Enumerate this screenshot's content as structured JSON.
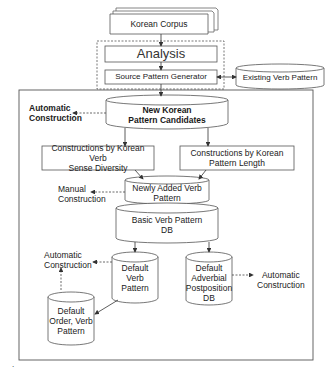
{
  "nodes": {
    "korean_corpus": "Korean Corpus",
    "analysis": "Analysis",
    "source_pattern_generator": "Source Pattern Generator",
    "existing_verb_pattern": "Existing Verb Pattern",
    "new_korean_pattern_candidates": [
      "New Korean",
      "Pattern Candidates"
    ],
    "constructions_sense_diversity": [
      "Constructions by Korean Verb",
      "Sense Diversity"
    ],
    "constructions_pattern_length": [
      "Constructions by Korean",
      "Pattern Length"
    ],
    "newly_added_verb_pattern": [
      "Newly Added Verb",
      "Pattern"
    ],
    "basic_verb_pattern_db": [
      "Basic Verb Pattern",
      "DB"
    ],
    "default_verb_pattern": [
      "Default",
      "Verb Pattern"
    ],
    "default_adverbial_postposition_db": [
      "Default",
      "Adverbial",
      "Postposition",
      "DB"
    ],
    "default_order_verb_pattern": [
      "Default",
      "Order, Verb",
      "Pattern"
    ]
  },
  "annotations": {
    "automatic_construction_top": [
      "Automatic",
      "Construction"
    ],
    "manual_construction": [
      "Manual",
      "Construction"
    ],
    "automatic_construction_left": [
      "Automatic",
      "Construction"
    ],
    "automatic_construction_right": [
      "Automatic",
      "Construction"
    ]
  },
  "footnote_mark": "."
}
